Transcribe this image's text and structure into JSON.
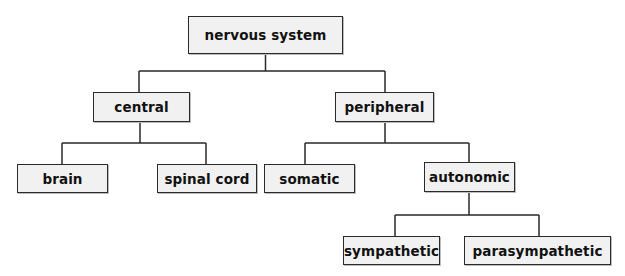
{
  "diagram": {
    "type": "tree",
    "nodes": {
      "root": {
        "label": "nervous system"
      },
      "central": {
        "label": "central"
      },
      "peripheral": {
        "label": "peripheral"
      },
      "brain": {
        "label": "brain"
      },
      "spinal_cord": {
        "label": "spinal cord"
      },
      "somatic": {
        "label": "somatic"
      },
      "autonomic": {
        "label": "autonomic"
      },
      "sympathetic": {
        "label": "sympathetic"
      },
      "parasympathetic": {
        "label": "parasympathetic"
      }
    },
    "edges": [
      [
        "nervous system",
        "central"
      ],
      [
        "nervous system",
        "peripheral"
      ],
      [
        "central",
        "brain"
      ],
      [
        "central",
        "spinal cord"
      ],
      [
        "peripheral",
        "somatic"
      ],
      [
        "peripheral",
        "autonomic"
      ],
      [
        "autonomic",
        "sympathetic"
      ],
      [
        "autonomic",
        "parasympathetic"
      ]
    ],
    "colors": {
      "box_fill": "#f1f1f1",
      "stroke": "#2a2a2a"
    }
  }
}
